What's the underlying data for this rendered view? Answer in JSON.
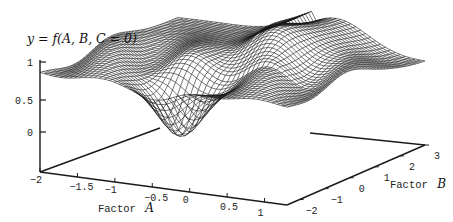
{
  "chart_data": {
    "type": "surface",
    "title": "y = f(A, B, C = 0)",
    "xlabel": "Factor A",
    "ylabel": "Factor B",
    "zlabel": "y",
    "x_axis": {
      "name": "Factor",
      "var": "A",
      "ticks": [
        "-2",
        "-1.5",
        "-1",
        "-0.5",
        "0",
        "0.5",
        "1"
      ],
      "range": [
        -2,
        1.3
      ]
    },
    "y_axis": {
      "name": "Factor",
      "var": "B",
      "ticks": [
        "-2",
        "-1",
        "0",
        "1",
        "2",
        "3"
      ],
      "range": [
        -2.5,
        3
      ]
    },
    "z_axis": {
      "ticks": [
        "1",
        "0.5",
        "0"
      ],
      "range": [
        -0.5,
        1
      ]
    },
    "grid": false,
    "colors": {
      "mesh": "#1a1a1a",
      "background": "#ffffff"
    }
  },
  "labels": {
    "title": "y = f(A, B, C = 0)",
    "z_ticks": [
      "1",
      "0.5",
      "0"
    ],
    "a_ticks": [
      "-2",
      "-1.5",
      "-1",
      "-0.5",
      "0",
      "0.5",
      "1"
    ],
    "b_ticks": [
      "-2",
      "-1",
      "0",
      "1",
      "2",
      "3"
    ],
    "a_title": "Factor",
    "a_var": "A",
    "b_title": "Factor",
    "b_var": "B"
  }
}
